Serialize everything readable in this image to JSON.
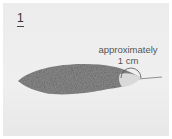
{
  "step": {
    "number": "1"
  },
  "annotation": {
    "line1": "approximately",
    "line2": "1 cm"
  },
  "figure": {
    "tip_marker": "semicircle-arc",
    "colors": {
      "body": "#8c8c8c",
      "tip": "#d8d8d8",
      "background": "#ececec"
    }
  }
}
